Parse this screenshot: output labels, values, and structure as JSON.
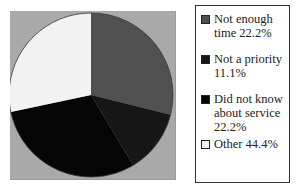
{
  "chart_data": {
    "type": "pie",
    "title": "",
    "categories": [
      "Not enough time",
      "Not a priority",
      "Did not know about service",
      "Other"
    ],
    "values": [
      22.2,
      11.1,
      22.2,
      44.4
    ],
    "value_unit": "%",
    "drawn_angles_deg": [
      104,
      45,
      109,
      102
    ],
    "start_angle_deg": 0,
    "direction": "clockwise",
    "legend_position": "right",
    "legend_labels": [
      "Not enough time 22.2%",
      "Not a priority 11.1%",
      "Did not know about service 22.2%",
      "Other 44.4%"
    ],
    "colors": [
      "#505050",
      "#161616",
      "#050505",
      "#f2f2f2"
    ],
    "plot_background": "#a9a9a9"
  },
  "legend": {
    "items": [
      {
        "line1": "Not enough",
        "line2": "time 22.2%",
        "color": "#505050"
      },
      {
        "line1": "Not a priority",
        "line2": "11.1%",
        "color": "#161616"
      },
      {
        "line1": "Did not know",
        "line2": "about service",
        "line3": "22.2%",
        "color": "#050505"
      },
      {
        "line1": "Other 44.4%",
        "color": "#f2f2f2"
      }
    ]
  }
}
